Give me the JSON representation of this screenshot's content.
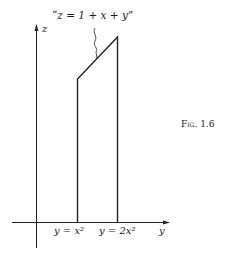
{
  "figure": {
    "caption": "Fig. 1.6",
    "annotation": "“z = 1 + x + y”",
    "axes": {
      "vertical_label": "z",
      "horizontal_label": "y"
    },
    "boundary_labels": {
      "left": "y = x²",
      "right": "y = 2x²"
    }
  }
}
